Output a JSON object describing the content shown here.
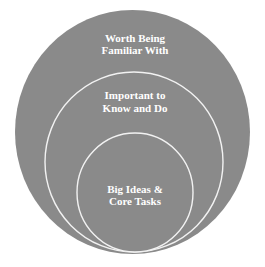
{
  "diagram": {
    "type": "nested-circles",
    "colors": {
      "fill": "#8a8a8a",
      "ring_stroke": "#f2f2f2",
      "text": "#ffffff",
      "background": "#ffffff"
    },
    "circles": [
      {
        "id": "outer",
        "lines": [
          "Worth Being",
          "Familiar With"
        ]
      },
      {
        "id": "middle",
        "lines": [
          "Important to",
          "Know and Do"
        ]
      },
      {
        "id": "inner",
        "lines": [
          "Big Ideas &",
          "Core Tasks"
        ]
      }
    ]
  }
}
